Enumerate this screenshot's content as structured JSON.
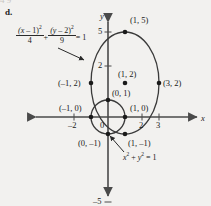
{
  "item_letter": "d.",
  "ghost_text_top": "4            9",
  "axes": {
    "x_axis_name": "x",
    "y_axis_name": "y",
    "x_ticks": [
      {
        "value": -2,
        "label": "–2"
      },
      {
        "value": 0,
        "label": "0"
      },
      {
        "value": 2,
        "label": "2"
      },
      {
        "value": 3,
        "label": "3"
      }
    ],
    "y_ticks": [
      {
        "value": 5,
        "label": "5"
      },
      {
        "value": 2,
        "label": "2"
      },
      {
        "value": -5,
        "label": "–5"
      }
    ],
    "x_range": [
      -3.2,
      5.4
    ],
    "y_range": [
      -5.9,
      5.9
    ],
    "grid": false,
    "origin_label": "0"
  },
  "equations": {
    "ellipse": {
      "text": "(x – 1)²/4 + (y – 2)²/9 = 1",
      "num1": "(x – 1)",
      "den1": "4",
      "num2": "(y – 2)",
      "den2": "9",
      "plus": "+",
      "equals": "= 1"
    },
    "circle": {
      "text": "x² + y² = 1",
      "lhs_a": "x",
      "plus": "+",
      "lhs_b": "y",
      "equals": "= 1"
    }
  },
  "points": [
    {
      "label": "(1, 5)",
      "x": 1,
      "y": 5
    },
    {
      "label": "(1, 2)",
      "x": 1,
      "y": 2
    },
    {
      "label": "(–1, 2)",
      "x": -1,
      "y": 2
    },
    {
      "label": "(3, 2)",
      "x": 3,
      "y": 2
    },
    {
      "label": "(0, 1)",
      "x": 0,
      "y": 1
    },
    {
      "label": "(–1, 0)",
      "x": -1,
      "y": 0
    },
    {
      "label": "(1, 0)",
      "x": 1,
      "y": 0
    },
    {
      "label": "(0, –1)",
      "x": 0,
      "y": -1
    },
    {
      "label": "(1, –1)",
      "x": 1,
      "y": -1
    }
  ],
  "curves": {
    "ellipse": {
      "center_x": 1,
      "center_y": 2,
      "a": 2,
      "b": 3
    },
    "circle": {
      "center_x": 0,
      "center_y": 0,
      "r": 1
    }
  },
  "colors": {
    "background": "#f2f1ef",
    "ink": "#2a2a2a",
    "axis": "#4a4a4a",
    "curve": "#3a3a3a"
  }
}
